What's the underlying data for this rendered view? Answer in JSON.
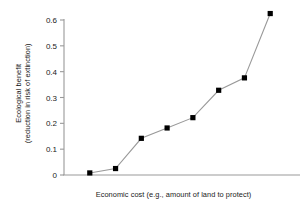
{
  "chart_data": {
    "type": "line",
    "title": "",
    "subtitle": "",
    "xlabel": "Economic cost (e.g., amount of land to protect)",
    "ylabel_line1": "Ecological benefit",
    "ylabel_line2": "(reduction in risk of extinction)",
    "ylabel": "Ecological benefit (reduction in risk of extinction)",
    "x": [
      1,
      2,
      3,
      4,
      5,
      6,
      7,
      8
    ],
    "values": [
      0.008,
      0.025,
      0.142,
      0.182,
      0.222,
      0.328,
      0.376,
      0.625
    ],
    "ylim": [
      0,
      0.65
    ],
    "xlim": [
      0,
      9
    ],
    "yticks": [
      0,
      0.1,
      0.2,
      0.3,
      0.4,
      0.5,
      0.6
    ],
    "ytick_labels": [
      "0",
      "0.1",
      "0.2",
      "0.3",
      "0.4",
      "0.5",
      "0.6"
    ],
    "xticks": [],
    "xtick_labels": [],
    "grid": false,
    "legend": false,
    "legend_position": "none",
    "marker": "square",
    "marker_color": "#000000",
    "line_color": "#999999",
    "axis_color": "#999999",
    "annotations": []
  }
}
